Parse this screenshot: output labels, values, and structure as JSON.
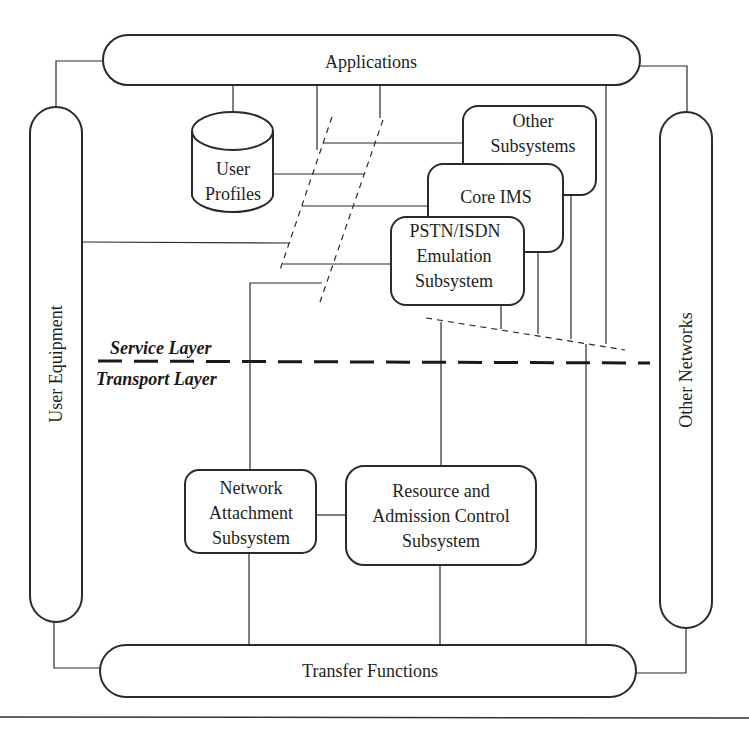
{
  "nodes": {
    "applications": {
      "label": "Applications"
    },
    "user_equipment": {
      "label": "User Equipment"
    },
    "other_networks": {
      "label": "Other Networks"
    },
    "transfer_functions": {
      "label": "Transfer Functions"
    },
    "user_profiles": {
      "lines": [
        "User",
        "Profiles"
      ]
    },
    "other_subsystems": {
      "lines": [
        "Other",
        "Subsystems"
      ]
    },
    "core_ims": {
      "lines": [
        "Core IMS"
      ]
    },
    "pstn_isdn": {
      "lines": [
        "PSTN/ISDN",
        "Emulation",
        "Subsystem"
      ]
    },
    "network_attachment": {
      "lines": [
        "Network",
        "Attachment",
        "Subsystem"
      ]
    },
    "racs": {
      "lines": [
        "Resource and",
        "Admission Control",
        "Subsystem"
      ]
    }
  },
  "layers": {
    "service": "Service Layer",
    "transport": "Transport Layer"
  },
  "colors": {
    "stroke": "#2a2a2a",
    "background": "#ffffff"
  }
}
